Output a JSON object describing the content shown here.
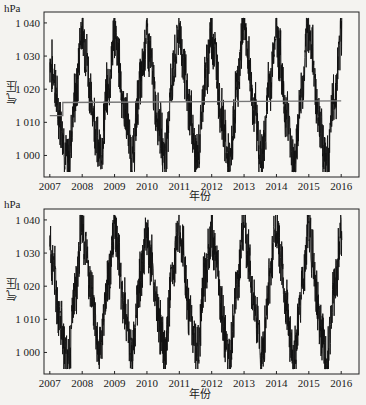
{
  "panels": [
    {
      "id": "top",
      "unit": "hPa",
      "ylabel": "气压",
      "xlabel": "年份",
      "yticks": [
        "1 040",
        "1 030",
        "1 020",
        "1 010",
        "1 000"
      ],
      "xticks": [
        "2007",
        "2008",
        "2009",
        "2010",
        "2011",
        "2012",
        "2013",
        "2014",
        "2015",
        "2016"
      ]
    },
    {
      "id": "bottom",
      "unit": "hPa",
      "ylabel": "气压",
      "xlabel": "年份",
      "yticks": [
        "1 040",
        "1 030",
        "1 020",
        "1 010",
        "1 000"
      ],
      "xticks": [
        "2007",
        "2008",
        "2009",
        "2010",
        "2011",
        "2012",
        "2013",
        "2014",
        "2015",
        "2016"
      ]
    }
  ],
  "colors": {
    "series": "#111111",
    "trend": "#777777",
    "axis": "#222222",
    "background": "#f4f3f0"
  },
  "chart_data": [
    {
      "type": "line",
      "title": "",
      "xlabel": "年份",
      "ylabel": "气压 (hPa)",
      "xlim": [
        2006.8,
        2016.6
      ],
      "ylim": [
        994,
        1043
      ],
      "grid": false,
      "legend": null,
      "x_ticks": [
        2007,
        2008,
        2009,
        2010,
        2011,
        2012,
        2013,
        2014,
        2015,
        2016
      ],
      "y_ticks": [
        1000,
        1010,
        1020,
        1030,
        1040
      ],
      "series": [
        {
          "name": "daily pressure",
          "description": "daily sea-level pressure, strong annual cycle: winter maxima ~1035-1041 hPa, summer minima ~996-1002 hPa",
          "x": [
            2007.0,
            2007.1,
            2007.3,
            2007.55,
            2007.8,
            2008.0,
            2008.1,
            2008.3,
            2008.55,
            2008.8,
            2009.0,
            2009.1,
            2009.3,
            2009.55,
            2009.8,
            2010.0,
            2010.1,
            2010.3,
            2010.55,
            2010.8,
            2011.0,
            2011.1,
            2011.3,
            2011.55,
            2011.8,
            2012.0,
            2012.1,
            2012.3,
            2012.55,
            2012.8,
            2013.0,
            2013.1,
            2013.3,
            2013.55,
            2013.8,
            2014.0,
            2014.1,
            2014.3,
            2014.55,
            2014.8,
            2015.0,
            2015.1,
            2015.3,
            2015.55,
            2015.8,
            2016.0
          ],
          "values": [
            1029,
            1025,
            1012,
            998,
            1018,
            1040,
            1032,
            1015,
            1000,
            1020,
            1037,
            1030,
            1014,
            1000,
            1022,
            1036,
            1029,
            1013,
            1001,
            1024,
            1038,
            1030,
            1014,
            999,
            1023,
            1037,
            1031,
            1012,
            997,
            1021,
            1041,
            1030,
            1015,
            999,
            1022,
            1038,
            1030,
            1013,
            998,
            1020,
            1039,
            1031,
            1012,
            997,
            1018,
            1036
          ]
        },
        {
          "name": "trend (step)",
          "description": "gray horizontal reference line",
          "x": [
            2007.0,
            2007.4,
            2007.4,
            2016.0
          ],
          "values": [
            1012,
            1012,
            1016,
            1016.5
          ]
        }
      ]
    },
    {
      "type": "line",
      "title": "",
      "xlabel": "年份",
      "ylabel": "气压 (hPa)",
      "xlim": [
        2006.8,
        2016.6
      ],
      "ylim": [
        994,
        1043
      ],
      "grid": false,
      "legend": null,
      "x_ticks": [
        2007,
        2008,
        2009,
        2010,
        2011,
        2012,
        2013,
        2014,
        2015,
        2016
      ],
      "y_ticks": [
        1000,
        1010,
        1020,
        1030,
        1040
      ],
      "series": [
        {
          "name": "daily pressure",
          "x": [
            2007.0,
            2007.1,
            2007.3,
            2007.55,
            2007.8,
            2008.0,
            2008.1,
            2008.3,
            2008.55,
            2008.8,
            2009.0,
            2009.1,
            2009.3,
            2009.55,
            2009.8,
            2010.0,
            2010.1,
            2010.3,
            2010.55,
            2010.8,
            2011.0,
            2011.1,
            2011.3,
            2011.55,
            2011.8,
            2012.0,
            2012.1,
            2012.3,
            2012.55,
            2012.8,
            2013.0,
            2013.1,
            2013.3,
            2013.55,
            2013.8,
            2014.0,
            2014.1,
            2014.3,
            2014.55,
            2014.8,
            2015.0,
            2015.1,
            2015.3,
            2015.55,
            2015.8,
            2016.0
          ],
          "values": [
            1033,
            1026,
            1012,
            997,
            1018,
            1040,
            1032,
            1015,
            1000,
            1020,
            1037,
            1030,
            1014,
            1000,
            1022,
            1036,
            1029,
            1013,
            1001,
            1024,
            1038,
            1030,
            1014,
            999,
            1023,
            1037,
            1031,
            1012,
            997,
            1021,
            1041,
            1030,
            1015,
            999,
            1022,
            1038,
            1030,
            1013,
            998,
            1020,
            1039,
            1031,
            1012,
            997,
            1018,
            1037
          ]
        }
      ]
    }
  ]
}
